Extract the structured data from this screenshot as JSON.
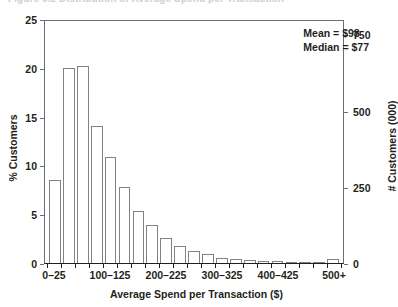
{
  "figure": {
    "cropped_caption_sliver": "Figure 6.2  Distribution of Average Spend per Transaction"
  },
  "annotation": {
    "mean": "Mean = $98",
    "median": "Median = $77"
  },
  "chart_data": {
    "type": "bar",
    "title": "",
    "xlabel": "Average Spend per Transaction ($)",
    "ylabel": "% Customers",
    "y2label": "# Customers (000)",
    "ylim": [
      0,
      25
    ],
    "y2lim": [
      0,
      800
    ],
    "yticks": [
      0,
      5,
      10,
      15,
      20,
      25
    ],
    "ytick_labels": [
      "0",
      "5",
      "10",
      "15",
      "20",
      "25"
    ],
    "y2ticks": [
      0,
      250,
      500,
      750
    ],
    "y2tick_labels": [
      "0",
      "250",
      "500",
      "750"
    ],
    "grid": false,
    "legend": "none",
    "categories": [
      "0–25",
      "25–50",
      "50–75",
      "75–100",
      "100–125",
      "125–150",
      "150–175",
      "175–200",
      "200–225",
      "225–250",
      "250–275",
      "275–300",
      "300–325",
      "325–350",
      "350–375",
      "375–400",
      "400–425",
      "425–450",
      "450–475",
      "475–500",
      "500+"
    ],
    "values": [
      8.6,
      20.1,
      20.4,
      14.2,
      11.0,
      7.9,
      5.4,
      3.9,
      2.6,
      1.8,
      1.2,
      0.9,
      0.55,
      0.45,
      0.3,
      0.25,
      0.2,
      0.15,
      0.1,
      0.08,
      0.45
    ],
    "xtick_labels": [
      "0–25",
      "100–125",
      "200–225",
      "300–325",
      "400–425",
      "500+"
    ],
    "xtick_category_index": [
      0,
      4,
      8,
      12,
      16,
      20
    ],
    "annotations": [
      "Mean = $98",
      "Median = $77"
    ],
    "colors": {
      "bar_fill": "#ffffff",
      "bar_edge": "#808285",
      "axis": "#231f20",
      "frame": "#6d6e71",
      "text": "#231f20",
      "background": "#ffffff"
    }
  }
}
